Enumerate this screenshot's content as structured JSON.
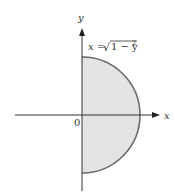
{
  "diagram": {
    "type": "region",
    "axes": {
      "x_label": "x",
      "y_label": "y",
      "origin_label": "0"
    },
    "curve_label": {
      "lhs": "x =",
      "radical": "√",
      "radicand": "1 − y",
      "exponent": "2"
    },
    "colors": {
      "fill": "#e3e3e3",
      "curve": "#6b6b6b",
      "axis": "#333333"
    }
  }
}
